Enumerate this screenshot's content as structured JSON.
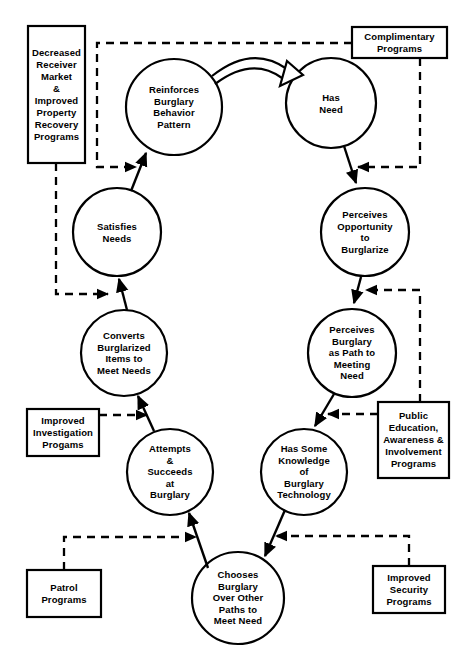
{
  "diagram": {
    "canvas": {
      "width": 473,
      "height": 670
    },
    "colors": {
      "stroke": "#000000",
      "fill": "#ffffff",
      "text": "#000000"
    },
    "nodes": [
      {
        "id": "reinforces",
        "label": "Reinforces\nBurglary\nBehavior\nPattern",
        "cx": 174,
        "cy": 107,
        "r": 48
      },
      {
        "id": "has-need",
        "label": "Has\nNeed",
        "cx": 331,
        "cy": 103,
        "r": 45
      },
      {
        "id": "satisfies-needs",
        "label": "Satisfies\nNeeds",
        "cx": 117,
        "cy": 232,
        "r": 44
      },
      {
        "id": "perceives-opportunity",
        "label": "Perceives\nOpportunity\nto\nBurglarize",
        "cx": 365,
        "cy": 232,
        "r": 44
      },
      {
        "id": "converts-burglarized",
        "label": "Converts\nBurglarized\nItems to\nMeet Needs",
        "cx": 124,
        "cy": 353,
        "r": 43
      },
      {
        "id": "perceives-path",
        "label": "Perceives\nBurglary\nas Path to\nMeeting\nNeed",
        "cx": 352,
        "cy": 353,
        "r": 44
      },
      {
        "id": "attempts-succeeds",
        "label": "Attempts\n&\nSucceeds\nat\nBurglary",
        "cx": 170,
        "cy": 472,
        "r": 43
      },
      {
        "id": "has-knowledge",
        "label": "Has Some\nKnowledge\nof\nBurglary\nTechnology",
        "cx": 304,
        "cy": 472,
        "r": 43
      },
      {
        "id": "chooses-burglary",
        "label": "Chooses\nBurglary\nOver Other\nPaths to\nMeet Need",
        "cx": 238,
        "cy": 598,
        "r": 46
      }
    ],
    "boxes": [
      {
        "id": "decreased-receiver",
        "label": "Decreased\nReceiver\nMarket\n&\nImproved\nProperty\nRecovery\nPrograms",
        "x": 28,
        "y": 26,
        "w": 57,
        "h": 137
      },
      {
        "id": "complimentary-programs",
        "label": "Complimentary\nPrograms",
        "x": 352,
        "y": 27,
        "w": 95,
        "h": 31
      },
      {
        "id": "improved-investigation",
        "label": "Improved\nInvestigation\nProgams",
        "x": 27,
        "y": 409,
        "w": 72,
        "h": 47
      },
      {
        "id": "public-education",
        "label": "Public\nEducation,\nAwareness &\nInvolvement\nPrograms",
        "x": 378,
        "y": 402,
        "w": 71,
        "h": 76
      },
      {
        "id": "patrol-programs",
        "label": "Patrol\nPrograms",
        "x": 27,
        "y": 570,
        "w": 74,
        "h": 47
      },
      {
        "id": "improved-security",
        "label": "Improved\nSecurity\nPrograms",
        "x": 373,
        "y": 566,
        "w": 72,
        "h": 47
      }
    ],
    "edges": [
      {
        "id": "reinforces-to-has-need",
        "style": "hollow-arrow",
        "from": "reinforces",
        "to": "has-need"
      },
      {
        "id": "has-need-to-perceives-opportunity",
        "style": "solid-arrow",
        "from": "has-need",
        "to": "perceives-opportunity"
      },
      {
        "id": "perceives-opportunity-to-perceives-path",
        "style": "solid-arrow",
        "from": "perceives-opportunity",
        "to": "perceives-path"
      },
      {
        "id": "perceives-path-to-has-knowledge",
        "style": "solid-arrow",
        "from": "perceives-path",
        "to": "has-knowledge"
      },
      {
        "id": "has-knowledge-to-chooses",
        "style": "solid-arrow",
        "from": "has-knowledge",
        "to": "chooses-burglary"
      },
      {
        "id": "chooses-to-attempts",
        "style": "solid-arrow",
        "from": "chooses-burglary",
        "to": "attempts-succeeds"
      },
      {
        "id": "attempts-to-converts",
        "style": "solid-arrow",
        "from": "attempts-succeeds",
        "to": "converts-burglarized"
      },
      {
        "id": "converts-to-satisfies",
        "style": "solid-arrow",
        "from": "converts-burglarized",
        "to": "satisfies-needs"
      },
      {
        "id": "satisfies-to-reinforces",
        "style": "solid-arrow",
        "from": "satisfies-needs",
        "to": "reinforces"
      },
      {
        "id": "complimentary-to-reinforces",
        "style": "dashed-arrow",
        "from": "complimentary-programs",
        "to": "reinforces"
      },
      {
        "id": "complimentary-to-perceives-opportunity",
        "style": "dashed-arrow",
        "from": "complimentary-programs",
        "to": "perceives-opportunity"
      },
      {
        "id": "decreased-receiver-to-satisfies",
        "style": "dashed-arrow",
        "from": "decreased-receiver",
        "to": "satisfies-needs"
      },
      {
        "id": "public-education-to-has-knowledge",
        "style": "dashed-arrow",
        "from": "public-education",
        "to": "has-knowledge"
      },
      {
        "id": "public-education-to-perceives-path",
        "style": "dashed-arrow",
        "from": "public-education",
        "to": "perceives-path"
      },
      {
        "id": "improved-investigation-to-converts",
        "style": "dashed-arrow",
        "from": "improved-investigation",
        "to": "converts-burglarized"
      },
      {
        "id": "improved-security-to-chooses",
        "style": "dashed-arrow",
        "from": "improved-security",
        "to": "chooses-burglary"
      },
      {
        "id": "patrol-to-attempts",
        "style": "dashed-arrow",
        "from": "patrol-programs",
        "to": "attempts-succeeds"
      }
    ]
  }
}
